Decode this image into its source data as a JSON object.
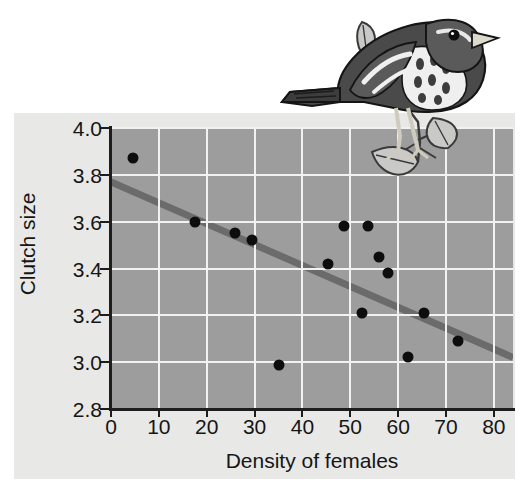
{
  "figure": {
    "background_color": "#ffffff",
    "panel_color": "#e8e8e6",
    "plot_background_color": "#9d9d9d",
    "gridline_color": "#f2f2f0",
    "axis_color": "#1d1d1d",
    "point_color": "#0d0d0d",
    "trendline_color": "#6b6b6b",
    "illustration_name": "sparrow-on-branch-illustration"
  },
  "chart_data": {
    "type": "scatter",
    "title": "",
    "xlabel": "Density of females",
    "ylabel": "Clutch size",
    "xlim": [
      0,
      84
    ],
    "ylim": [
      2.8,
      4.0
    ],
    "xticks": [
      0,
      10,
      20,
      30,
      40,
      50,
      60,
      70,
      80
    ],
    "xtick_labels": [
      "0",
      "10",
      "20",
      "30",
      "40",
      "50",
      "60",
      "70",
      "80"
    ],
    "yticks": [
      2.8,
      3.0,
      3.2,
      3.4,
      3.6,
      3.8,
      4.0
    ],
    "ytick_labels": [
      "2.8",
      "3.0",
      "3.2",
      "3.4",
      "3.6",
      "3.8",
      "4.0"
    ],
    "grid": true,
    "legend": false,
    "series": [
      {
        "name": "observations",
        "marker": "filled-circle",
        "x": [
          4.6,
          17.6,
          25.9,
          29.5,
          35.0,
          45.4,
          48.7,
          53.8,
          52.5,
          55.9,
          57.9,
          62.1,
          65.3,
          72.6
        ],
        "y": [
          3.87,
          3.6,
          3.55,
          3.52,
          2.99,
          3.42,
          3.58,
          3.58,
          3.21,
          3.45,
          3.38,
          3.02,
          3.21,
          3.09
        ]
      }
    ],
    "trendline": {
      "name": "regression-line",
      "x": [
        0,
        84
      ],
      "y": [
        3.77,
        3.02
      ],
      "color": "#6b6b6b"
    }
  }
}
